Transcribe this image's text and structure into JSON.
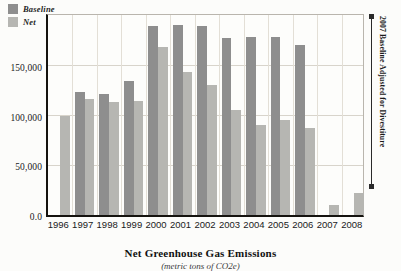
{
  "chart_data": {
    "type": "bar",
    "title": "Net Greenhouse Gas Emissions",
    "subtitle": "(metric tons of CO2e)",
    "xlabel": "",
    "ylabel": "",
    "categories": [
      "1996",
      "1997",
      "1998",
      "1999",
      "2000",
      "2001",
      "2002",
      "2003",
      "2004",
      "2005",
      "2006",
      "2007",
      "2008"
    ],
    "series": [
      {
        "name": "Baseline",
        "color": "#8e8e8e",
        "values": [
          null,
          124000,
          122000,
          135000,
          191000,
          192000,
          191000,
          179000,
          180000,
          180000,
          172000,
          null,
          null
        ]
      },
      {
        "name": "Net",
        "color": "#b6b6b2",
        "values": [
          100000,
          117000,
          114000,
          115000,
          170000,
          144000,
          131000,
          106000,
          91000,
          96000,
          88000,
          10000,
          22000
        ]
      }
    ],
    "ylim": [
      0,
      205000
    ],
    "yticks": [
      0,
      50000,
      100000,
      150000
    ],
    "ytick_labels": [
      "0.0",
      "50,000",
      "100,000",
      "150,000"
    ],
    "grid": true,
    "legend_position": "top-left",
    "annotations": [
      {
        "text": "2007 Baseline Adjusted for Divestiture",
        "position": "right",
        "orientation": "vertical"
      }
    ]
  }
}
